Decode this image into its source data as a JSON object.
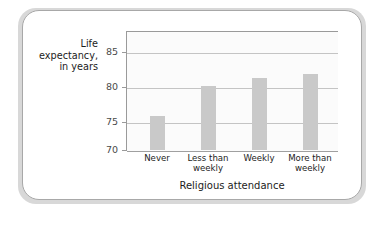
{
  "chart_data": {
    "type": "bar",
    "title": "",
    "xlabel": "Religious attendance",
    "ylabel": "Life expectancy, in years",
    "ylabel_lines": [
      "Life",
      "expectancy,",
      "in years"
    ],
    "categories": [
      "Never",
      "Less than weekly",
      "Weekly",
      "More than weekly"
    ],
    "category_lines": [
      [
        "Never"
      ],
      [
        "Less than",
        "weekly"
      ],
      [
        "Weekly"
      ],
      [
        "More than",
        "weekly"
      ]
    ],
    "values": [
      75.2,
      79.8,
      81.0,
      81.6
    ],
    "ylim": [
      70,
      87.5
    ],
    "yticks": [
      70,
      75,
      80,
      85
    ],
    "ytick_labels": [
      "70",
      "75",
      "80",
      "85"
    ],
    "grid": true,
    "legend": "none",
    "bar_color": "#c9c9c9",
    "gridline_color": "#c4c4c4",
    "axis_color": "#9a9a9a",
    "plot_background": "#fbfbfb",
    "card_background": "#ffffff",
    "frame_color": "#d8d8d8"
  }
}
